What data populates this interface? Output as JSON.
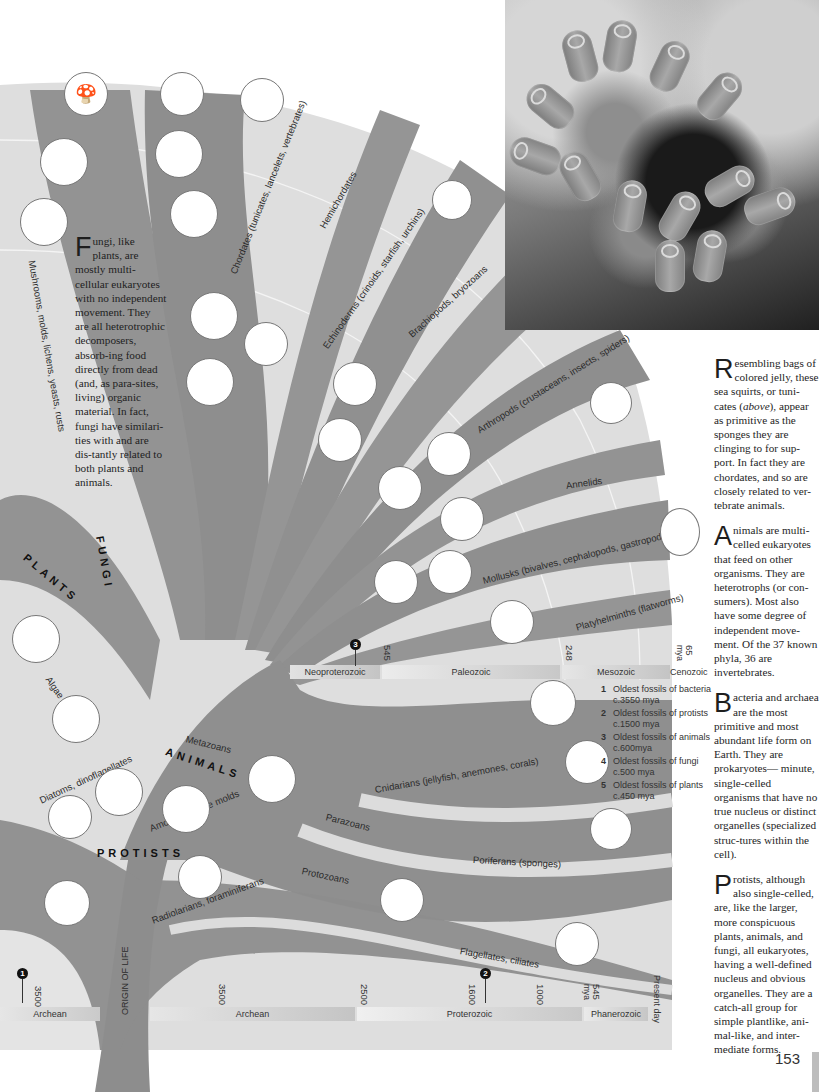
{
  "page": {
    "number": "153",
    "photo_caption_ref": "above"
  },
  "kingdoms": {
    "plants": "PLANTS",
    "fungi": "FUNGI",
    "animals": "ANIMALS",
    "protists": "PROTISTS"
  },
  "branches": {
    "mushrooms": "Mushrooms, molds, lichens, yeasts, rusts",
    "chordates": "Chordates (tunicates, lancelets, vertebrates)",
    "hemichordates": "Hemichordates",
    "echinoderms": "Echinoderms (crinoids, starfish, urchins)",
    "brachiopods": "Brachiopods, bryozoans",
    "arthropods": "Arthropods (crustaceans, insects, spiders)",
    "annelids": "Annelids",
    "mollusks": "Mollusks (bivalves, cephalopods, gastropods)",
    "platyhelminths": "Platyhelminths (flatworms)",
    "algae": "Algae",
    "diatoms": "Diatoms, dinoflagellates",
    "metazoans": "Metazoans",
    "amoebas": "Amoebas, slime molds",
    "radiolarians": "Radiolarians, foraminiferans",
    "cnidarians": "Cnidarians (jellyfish, anemones, corals)",
    "parazoans": "Parazoans",
    "poriferans": "Poriferans (sponges)",
    "protozoans": "Protozoans",
    "flagellates": "Flagellates, ciliates",
    "origin": "ORIGIN OF LIFE"
  },
  "upper_timeline": {
    "eras": [
      "Neoproterozoic",
      "Paleozoic",
      "Mesozoic",
      "Cenozoic"
    ],
    "ticks": [
      "545",
      "248",
      "65",
      "mya"
    ],
    "marker": "3"
  },
  "lower_timeline": {
    "eras": [
      "Archean",
      "Archean",
      "Proterozoic",
      "Phanerozoic"
    ],
    "ticks": [
      "3500",
      "3500",
      "2500",
      "1600",
      "1000",
      "545",
      "mya"
    ],
    "present": "Present day",
    "markers": [
      "1",
      "2"
    ]
  },
  "legend": [
    {
      "num": "1",
      "text": "Oldest fossils of bacteria c.3550 mya"
    },
    {
      "num": "2",
      "text": "Oldest fossils of protists c.1500 mya"
    },
    {
      "num": "3",
      "text": "Oldest fossils of animals c.600mya"
    },
    {
      "num": "4",
      "text": "Oldest fossils of fungi c.500 mya"
    },
    {
      "num": "5",
      "text": "Oldest fossils of plants c.450 mya"
    }
  ],
  "text_blocks": {
    "fungi": {
      "cap": "F",
      "body": "ungi, like plants, are mostly multi-cellular eukaryotes with no independent movement. They are all heterotrophic decomposers, absorb-ing food directly from dead (and, as para-sites, living) organic material. In fact, fungi have similari-ties with and are dis-tantly related to both plants and animals."
    },
    "tunicates": {
      "cap": "R",
      "body_pre": "esembling bags of colored jelly, these sea squirts, or tuni-cates (",
      "body_em": "above",
      "body_post": "), appear as primitive as the sponges they are clinging to for sup-port. In fact they are chordates, and so are closely related to ver-tebrate animals."
    },
    "animals": {
      "cap": "A",
      "body": "nimals are multi-celled eukaryotes that feed on other organisms. They are heterotrophs (or con-sumers). Most also have some degree of independent move-ment. Of the 37 known phyla, 36 are invertebrates."
    },
    "bacteria": {
      "cap": "B",
      "body": "acteria and archaea are the most primitive and most abundant life form on Earth. They are prokaryotes— minute, single-celled organisms that have no true nucleus or distinct organelles (specialized struc-tures within the cell)."
    },
    "protists": {
      "cap": "P",
      "body": "rotists, although also single-celled, are, like the larger, more conspicuous plants, animals, and fungi, all eukaryotes, having a well-defined nucleus and obvious organelles. They are a catch-all group for simple plantlike, ani-mal-like, and inter-mediate forms."
    }
  },
  "colors": {
    "branch": "#8f8f8f",
    "background_band": "#dcdcdc",
    "light_band": "#ececec",
    "timebar": "#c9c9c9"
  }
}
